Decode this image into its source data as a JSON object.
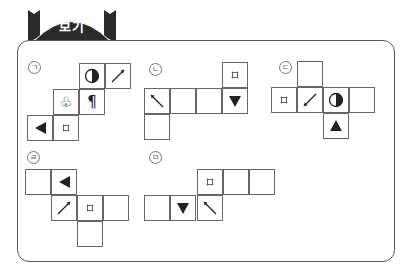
{
  "header": {
    "title": "보기"
  },
  "colors": {
    "tab_fill": "#2b2b2b",
    "border": "#555555",
    "cell_border": "#666666"
  },
  "nets": [
    {
      "id": "ga",
      "label": "ㄱ",
      "label_pos": [
        28,
        61
      ],
      "cells": [
        {
          "x": 79,
          "y": 63,
          "icon": "half-circle-icon"
        },
        {
          "x": 105,
          "y": 63,
          "icon": "arrow-up-right-icon"
        },
        {
          "x": 53,
          "y": 89,
          "icon": "club-icon"
        },
        {
          "x": 79,
          "y": 89,
          "icon": "pilcrow-icon"
        },
        {
          "x": 27,
          "y": 115,
          "icon": "triangle-left-icon"
        },
        {
          "x": 53,
          "y": 115,
          "icon": "small-square-icon"
        }
      ]
    },
    {
      "id": "na",
      "label": "ㄴ",
      "label_pos": [
        149,
        63
      ],
      "cells": [
        {
          "x": 222,
          "y": 62,
          "icon": "small-square-icon"
        },
        {
          "x": 144,
          "y": 88,
          "icon": "arrow-up-left-icon"
        },
        {
          "x": 170,
          "y": 88,
          "icon": ""
        },
        {
          "x": 196,
          "y": 88,
          "icon": ""
        },
        {
          "x": 222,
          "y": 88,
          "icon": "triangle-down-icon"
        },
        {
          "x": 144,
          "y": 114,
          "icon": ""
        }
      ]
    },
    {
      "id": "da",
      "label": "ㄷ",
      "label_pos": [
        279,
        61
      ],
      "cells": [
        {
          "x": 297,
          "y": 61,
          "icon": ""
        },
        {
          "x": 271,
          "y": 87,
          "icon": "small-square-icon"
        },
        {
          "x": 297,
          "y": 87,
          "icon": "arrow-down-left-icon"
        },
        {
          "x": 323,
          "y": 87,
          "icon": "half-circle-icon"
        },
        {
          "x": 349,
          "y": 87,
          "icon": ""
        },
        {
          "x": 323,
          "y": 113,
          "icon": "triangle-up-icon"
        }
      ]
    },
    {
      "id": "ra",
      "label": "ㄹ",
      "label_pos": [
        27,
        151
      ],
      "cells": [
        {
          "x": 25,
          "y": 169,
          "icon": ""
        },
        {
          "x": 51,
          "y": 169,
          "icon": "triangle-left-icon"
        },
        {
          "x": 51,
          "y": 195,
          "icon": "arrow-up-right-icon"
        },
        {
          "x": 77,
          "y": 195,
          "icon": "small-square-icon"
        },
        {
          "x": 103,
          "y": 195,
          "icon": ""
        },
        {
          "x": 77,
          "y": 221,
          "icon": ""
        }
      ]
    },
    {
      "id": "ma",
      "label": "ㅁ",
      "label_pos": [
        149,
        151
      ],
      "cells": [
        {
          "x": 197,
          "y": 169,
          "icon": "small-square-icon"
        },
        {
          "x": 223,
          "y": 169,
          "icon": ""
        },
        {
          "x": 249,
          "y": 169,
          "icon": ""
        },
        {
          "x": 144,
          "y": 195,
          "icon": ""
        },
        {
          "x": 170,
          "y": 195,
          "icon": "triangle-down-icon"
        },
        {
          "x": 197,
          "y": 195,
          "icon": "arrow-up-left-icon"
        }
      ]
    }
  ]
}
